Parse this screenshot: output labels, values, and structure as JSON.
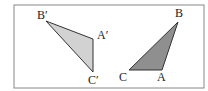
{
  "diagram": {
    "type": "geometry-reflection",
    "frame": {
      "x": 14,
      "y": 5,
      "width": 190,
      "height": 83,
      "stroke": "#888888"
    },
    "triangles": [
      {
        "name": "original",
        "fill": "#8f8f8f",
        "stroke": "#333333",
        "vertices": {
          "A": {
            "x": 162,
            "y": 70,
            "label": "A",
            "lx": 157,
            "ly": 81
          },
          "B": {
            "x": 178,
            "y": 22,
            "label": "B",
            "lx": 175,
            "ly": 17
          },
          "C": {
            "x": 129,
            "y": 70,
            "label": "C",
            "lx": 119,
            "ly": 81
          }
        }
      },
      {
        "name": "image",
        "fill": "#d2d2d2",
        "stroke": "#333333",
        "vertices": {
          "A": {
            "x": 93,
            "y": 39,
            "label": "A′",
            "lx": 97,
            "ly": 39
          },
          "B": {
            "x": 46,
            "y": 21,
            "label": "B′",
            "lx": 37,
            "ly": 19
          },
          "C": {
            "x": 93,
            "y": 72,
            "label": "C′",
            "lx": 88,
            "ly": 84
          }
        }
      }
    ]
  }
}
